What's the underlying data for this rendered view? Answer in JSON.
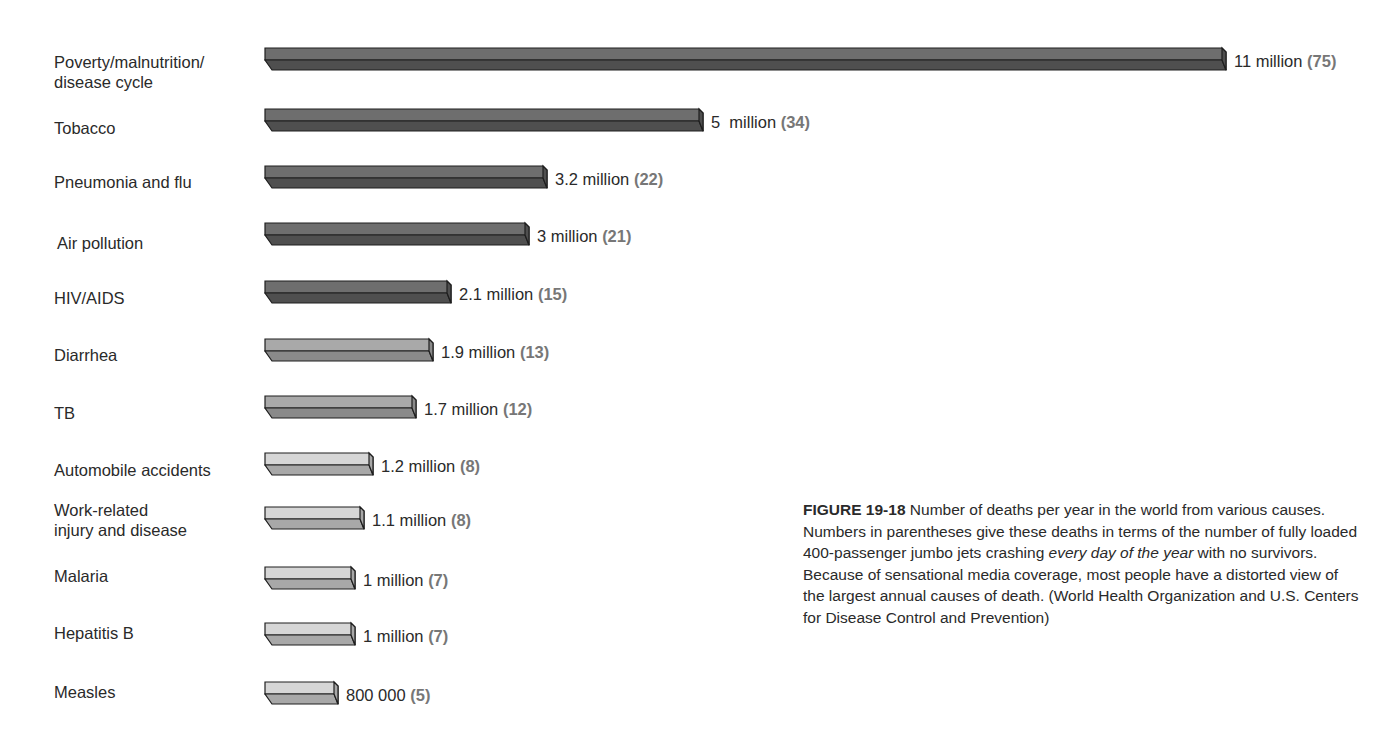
{
  "chart_data": {
    "type": "bar",
    "orientation": "horizontal",
    "title": "",
    "xlabel": "",
    "ylabel": "",
    "grid": false,
    "legend": null,
    "unit": "deaths per year",
    "categories": [
      "Poverty/malnutrition/\ndisease cycle",
      "Tobacco",
      "Pneumonia and flu",
      "Air pollution",
      "HIV/AIDS",
      "Diarrhea",
      "TB",
      "Automobile accidents",
      "Work-related\ninjury and disease",
      "Malaria",
      "Hepatitis B",
      "Measles"
    ],
    "values": [
      11000000,
      5000000,
      3200000,
      3000000,
      2100000,
      1900000,
      1700000,
      1200000,
      1100000,
      1000000,
      1000000,
      800000
    ],
    "value_labels": [
      "11 million",
      "5  million",
      "3.2 million",
      "3 million",
      "2.1 million",
      "1.9 million",
      "1.7 million",
      "1.2 million",
      "1.1 million",
      "1 million",
      "1 million",
      "800 000"
    ],
    "jumbo_jets_per_day": [
      75,
      34,
      22,
      21,
      15,
      13,
      12,
      8,
      8,
      7,
      7,
      5
    ],
    "jets_labels": [
      "(75)",
      "(34)",
      "(22)",
      "(21)",
      "(15)",
      "(13)",
      "(12)",
      "(8)",
      "(8)",
      "(7)",
      "(7)",
      "(5)"
    ],
    "shade_tiers": [
      "dark",
      "dark",
      "dark",
      "dark",
      "dark",
      "medium",
      "medium",
      "light",
      "light",
      "light",
      "light",
      "light"
    ]
  },
  "colors": {
    "dark_top": "#6e6e6e",
    "dark_bottom": "#4f4f4f",
    "medium_top": "#a9a9a9",
    "medium_bottom": "#8a8a8a",
    "light_top": "#d6d6d6",
    "light_bottom": "#a8a8a8",
    "outline": "#1e1e1e"
  },
  "caption": {
    "figure_label": "FIGURE 19-18",
    "text_before_italic": " Number of deaths per year in the world from various causes. Numbers in parentheses give these deaths in terms of the number of fully loaded 400-passenger jumbo jets crashing ",
    "italic_text": "every day of the year",
    "text_after_italic": " with no survivors. Because of sensational media coverage, most people have a distorted view of the largest annual causes of death. (World Health Organization and U.S. Centers for Disease Control and Prevention)"
  }
}
